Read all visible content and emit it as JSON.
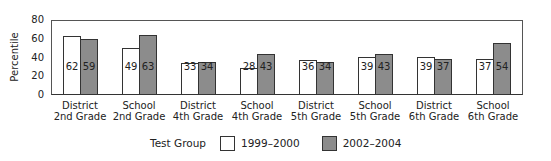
{
  "chart_data": {
    "type": "bar",
    "title": "",
    "xlabel": "",
    "ylabel": "Percentile",
    "ylim": [
      0,
      80
    ],
    "yticks": [
      0,
      20,
      40,
      60,
      80
    ],
    "grid": false,
    "legend_position": "bottom",
    "legend_title": "Test Group",
    "categories": [
      "District 2nd Grade",
      "School 2nd Grade",
      "District 4th Grade",
      "School 4th Grade",
      "District 5th Grade",
      "School 5th Grade",
      "District 6th Grade",
      "School 6th Grade"
    ],
    "category_lines": [
      [
        "District",
        "2nd Grade"
      ],
      [
        "School",
        "2nd Grade"
      ],
      [
        "District",
        "4th Grade"
      ],
      [
        "School",
        "4th Grade"
      ],
      [
        "District",
        "5th Grade"
      ],
      [
        "School",
        "5th Grade"
      ],
      [
        "District",
        "6th Grade"
      ],
      [
        "School",
        "6th Grade"
      ]
    ],
    "series": [
      {
        "name": "1999–2000",
        "color": "#ffffff",
        "values": [
          62,
          49,
          33,
          28,
          36,
          39,
          39,
          37
        ]
      },
      {
        "name": "2002–2004",
        "color": "#8c8c8c",
        "values": [
          59,
          63,
          34,
          43,
          34,
          43,
          37,
          54
        ]
      }
    ]
  }
}
